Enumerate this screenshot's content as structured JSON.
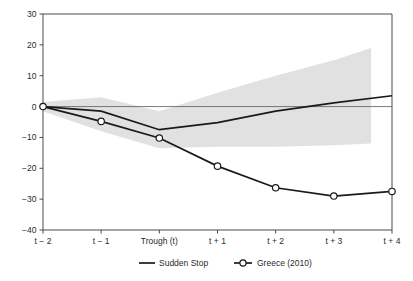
{
  "chart_data": {
    "type": "line",
    "title": "",
    "subtitle": "",
    "xlabel": "",
    "ylabel": "",
    "grid": false,
    "ylim": [
      -40,
      30
    ],
    "yticks": [
      30,
      20,
      10,
      0,
      -10,
      -20,
      -30,
      -40
    ],
    "ytick_labels": [
      "30",
      "20",
      "10",
      "0",
      "-10",
      "-20",
      "-30",
      "-40"
    ],
    "categories": [
      "t − 2",
      "t − 1",
      "Trough (t)",
      "t + 1",
      "t + 2",
      "t + 3",
      "t + 4"
    ],
    "x": [
      0,
      1,
      2,
      3,
      4,
      5,
      6
    ],
    "legend_position": "bottom",
    "series": [
      {
        "name": "Sudden Stop",
        "style": "solid-line",
        "marker": "none",
        "color": "#1a1a1a",
        "values": [
          0,
          -1.5,
          -7.5,
          -5.2,
          -1.5,
          1.2,
          3.5
        ]
      },
      {
        "name": "Greece (2010)",
        "style": "line-with-markers",
        "marker": "open-circle",
        "color": "#1a1a1a",
        "values": [
          0,
          -4.8,
          -10.2,
          -19.3,
          -26.3,
          -29.0,
          -27.5
        ]
      }
    ],
    "confidence_band": {
      "name": "Sudden Stop confidence interval",
      "color": "#dcdcdc",
      "upper": [
        1.5,
        3.0,
        -1.5,
        4.5,
        10.0,
        15.0,
        19.0
      ],
      "lower": [
        -1.5,
        -8.0,
        -13.5,
        -13.0,
        -13.0,
        -12.5,
        -12.0
      ],
      "x_end_fraction": 0.94
    },
    "annotations": []
  },
  "legend": {
    "items": [
      {
        "label": "Sudden Stop",
        "marker": "solid-line"
      },
      {
        "label": "Greece (2010)",
        "marker": "line-open-circle"
      }
    ]
  }
}
